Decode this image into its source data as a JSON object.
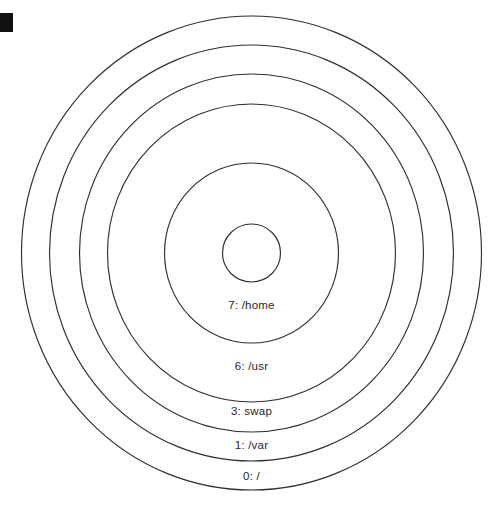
{
  "figure": {
    "type": "concentric-ring-partition-diagram",
    "background_color": "#ffffff",
    "stroke_color": "#2f2f2f",
    "text_color": "#262626",
    "center": {
      "x": 251.5,
      "y": 253
    },
    "corner_marker": {
      "name": "selection-marker",
      "color": "#111111",
      "x": 0,
      "y": 13,
      "width": 13,
      "height": 19
    }
  },
  "chart_data": {
    "type": "pie",
    "title": "",
    "subtitle": "",
    "xlabel": "",
    "ylabel": "",
    "legend_position": "none",
    "grid": false,
    "note": "Nested concentric rings; each ring is one disk partition labelled index and mount point.",
    "rings": [
      {
        "index": 0,
        "label": "0: /",
        "partition": "0",
        "mount": "/",
        "rx": 230,
        "ry": 237,
        "label_x": 251.5,
        "label_y": 477
      },
      {
        "index": 1,
        "label": "1: /var",
        "partition": "1",
        "mount": "/var",
        "rx": 202,
        "ry": 208,
        "label_x": 251.5,
        "label_y": 446
      },
      {
        "index": 2,
        "label": "3: swap",
        "partition": "3",
        "mount": "swap",
        "rx": 172,
        "ry": 179,
        "label_x": 251.5,
        "label_y": 412
      },
      {
        "index": 3,
        "label": "6: /usr",
        "partition": "6",
        "mount": "/usr",
        "rx": 144,
        "ry": 149,
        "label_x": 251.5,
        "label_y": 367
      },
      {
        "index": 4,
        "label": "7: /home",
        "partition": "7",
        "mount": "/home",
        "rx": 87,
        "ry": 90,
        "label_x": 251.5,
        "label_y": 306
      },
      {
        "index": 5,
        "label": "",
        "partition": "",
        "mount": "",
        "rx": 29,
        "ry": 29,
        "label_x": null,
        "label_y": null
      }
    ]
  }
}
